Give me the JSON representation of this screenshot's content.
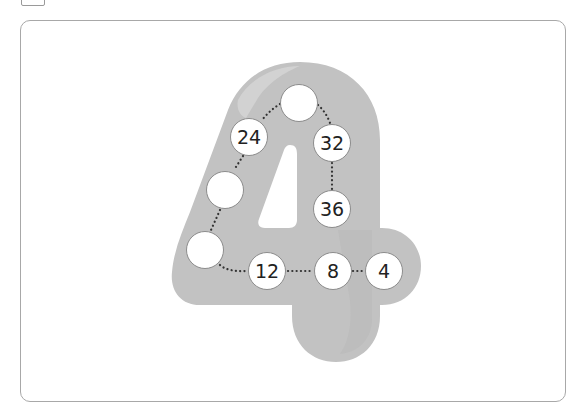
{
  "puzzle": {
    "digit": "4",
    "shape_color": "#c2c2c2",
    "shape_highlight": "#d4d4d4",
    "circle_fill": "#ffffff",
    "circle_border": "#8c8c8c",
    "circles": [
      {
        "id": "top",
        "value": ""
      },
      {
        "id": "c24",
        "value": "24"
      },
      {
        "id": "c32",
        "value": "32"
      },
      {
        "id": "left-upper",
        "value": ""
      },
      {
        "id": "c36",
        "value": "36"
      },
      {
        "id": "left-lower",
        "value": ""
      },
      {
        "id": "c12",
        "value": "12"
      },
      {
        "id": "c8",
        "value": "8"
      },
      {
        "id": "c4",
        "value": "4"
      }
    ]
  }
}
